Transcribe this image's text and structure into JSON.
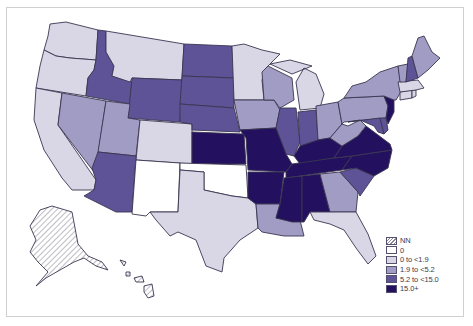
{
  "map": {
    "type": "choropleth",
    "region": "United States",
    "palette": {
      "NN": "hatch",
      "zero": "#ffffff",
      "low": "#d9d6e6",
      "mid": "#a19cc3",
      "high": "#5f5398",
      "top": "#23115f"
    },
    "legend": [
      {
        "key": "NN",
        "label": "NN"
      },
      {
        "key": "zero",
        "label": "0"
      },
      {
        "key": "low",
        "label": "0 to <1.9"
      },
      {
        "key": "mid",
        "label": "1.9 to <5.2"
      },
      {
        "key": "high",
        "label": "5.2 to <15.0"
      },
      {
        "key": "top",
        "label": "15.0+"
      }
    ],
    "states": {
      "WA": "low",
      "OR": "low",
      "CA": "low",
      "NV": "mid",
      "ID": "high",
      "MT": "low",
      "WY": "high",
      "UT": "mid",
      "CO": "low",
      "AZ": "high",
      "NM": "zero",
      "ND": "high",
      "SD": "high",
      "NE": "high",
      "KS": "top",
      "OK": "zero",
      "TX": "low",
      "MN": "low",
      "IA": "mid",
      "MO": "top",
      "AR": "top",
      "LA": "mid",
      "WI": "mid",
      "IL": "high",
      "MI": "low",
      "IN": "high",
      "OH": "mid",
      "KY": "top",
      "TN": "top",
      "MS": "top",
      "AL": "top",
      "GA": "mid",
      "FL": "low",
      "SC": "high",
      "NC": "top",
      "VA": "top",
      "WV": "mid",
      "MD": "high",
      "DE": "high",
      "PA": "mid",
      "NJ": "top",
      "NY": "mid",
      "CT": "low",
      "RI": "low",
      "MA": "low",
      "VT": "mid",
      "NH": "high",
      "ME": "mid",
      "AK": "NN",
      "HI": "NN"
    }
  }
}
